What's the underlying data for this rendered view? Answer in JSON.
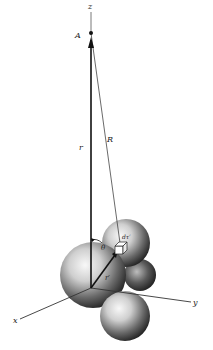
{
  "figure": {
    "labels": {
      "z_axis": "z",
      "x_axis": "x",
      "y_axis": "y",
      "point": "A",
      "r": "r",
      "R": "R",
      "r_prime": "r′",
      "theta": "θ",
      "dtau": "dτ′"
    },
    "colors": {
      "axis": "#333333",
      "vector": "#111111",
      "sphere_light": "#f4f4f4",
      "sphere_dark": "#2a2a2a",
      "background": "#ffffff"
    },
    "geometry": {
      "origin": [
        91,
        288
      ],
      "point_A": [
        91,
        33
      ],
      "volume_element": [
        120,
        246
      ],
      "x_axis_end": [
        22,
        318
      ],
      "y_axis_end": [
        192,
        302
      ],
      "z_axis_top": [
        91,
        12
      ]
    }
  }
}
